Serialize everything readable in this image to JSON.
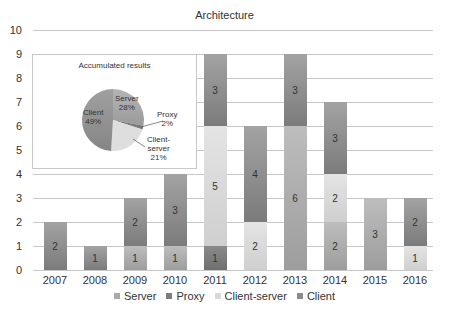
{
  "chart_data": {
    "type": "bar",
    "stacked": true,
    "title": "Architecture",
    "xlabel": "",
    "ylabel": "",
    "ylim": [
      0,
      10
    ],
    "yticks": [
      "0",
      "1",
      "2",
      "3",
      "4",
      "5",
      "6",
      "7",
      "8",
      "9",
      "10"
    ],
    "grid": true,
    "legend_position": "bottom",
    "categories": [
      "2007",
      "2008",
      "2009",
      "2010",
      "2011",
      "2012",
      "2013",
      "2014",
      "2015",
      "2016"
    ],
    "series": [
      {
        "name": "Server",
        "color": "#a9a9a9",
        "values": [
          0,
          0,
          1,
          1,
          0,
          0,
          6,
          2,
          3,
          0
        ]
      },
      {
        "name": "Proxy",
        "color": "#7d7d7d",
        "values": [
          0,
          0,
          0,
          0,
          1,
          0,
          0,
          0,
          0,
          0
        ]
      },
      {
        "name": "Client-server",
        "color": "#d9d9d9",
        "values": [
          0,
          0,
          0,
          0,
          5,
          2,
          0,
          2,
          0,
          1
        ]
      },
      {
        "name": "Client",
        "color": "#8c8c8c",
        "values": [
          2,
          1,
          2,
          3,
          3,
          4,
          3,
          3,
          0,
          2
        ]
      }
    ],
    "inset": {
      "type": "pie",
      "title": "Accumulated results",
      "slices": [
        {
          "name": "Server",
          "value": 28,
          "label": "28%"
        },
        {
          "name": "Proxy",
          "value": 2,
          "label": "2%"
        },
        {
          "name": "Client-server",
          "value": 21,
          "label": "21%"
        },
        {
          "name": "Client",
          "value": 49,
          "label": "49%"
        }
      ]
    }
  },
  "legend": [
    {
      "label": "Server",
      "color": "#a9a9a9"
    },
    {
      "label": "Proxy",
      "color": "#7d7d7d"
    },
    {
      "label": "Client-server",
      "color": "#d9d9d9"
    },
    {
      "label": "Client",
      "color": "#8c8c8c"
    }
  ],
  "pie_labels": {
    "server": "Server",
    "server_pct": "28%",
    "proxy": "Proxy",
    "proxy_pct": "2%",
    "client_server_1": "Client-",
    "client_server_2": "server",
    "client_server_pct": "21%",
    "client": "Client",
    "client_pct": "49%"
  }
}
